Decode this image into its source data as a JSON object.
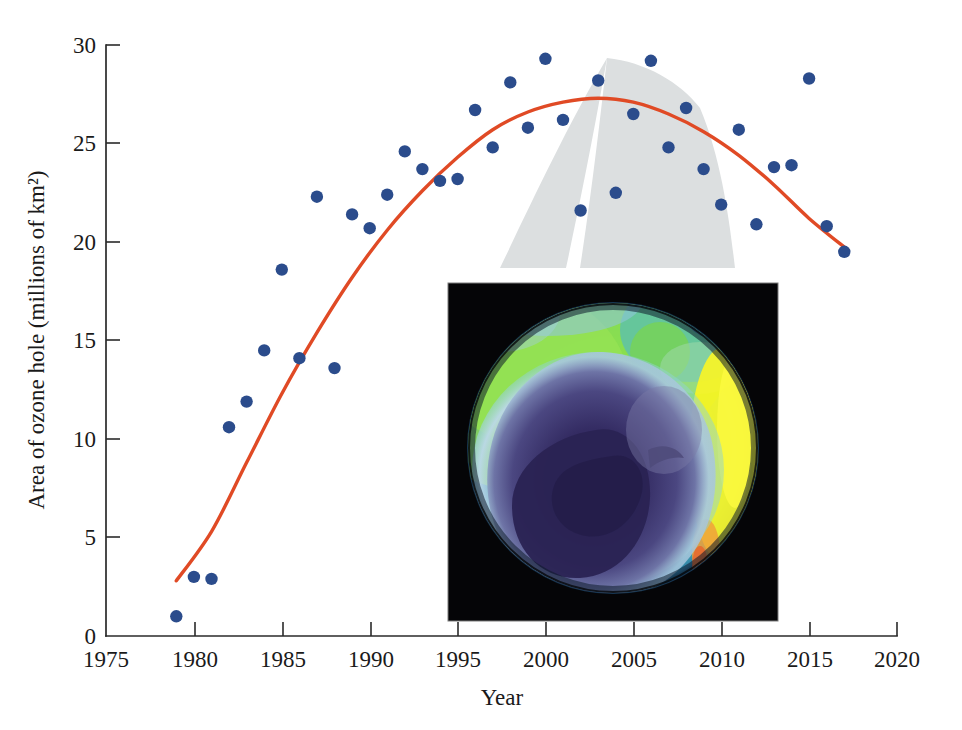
{
  "chart_data": {
    "type": "scatter",
    "title": "",
    "subtitle": "",
    "xlabel": "Year",
    "ylabel": "Area of ozone hole (millions of km²)",
    "xlim": [
      1975,
      2020
    ],
    "ylim": [
      0,
      30
    ],
    "xticks": [
      1975,
      1980,
      1985,
      1990,
      1995,
      2000,
      2005,
      2010,
      2015,
      2020
    ],
    "yticks": [
      0,
      5,
      10,
      15,
      20,
      25,
      30
    ],
    "xtick_labels": [
      "1975",
      "1980",
      "1985",
      "1990",
      "1995",
      "2000",
      "2005",
      "2010",
      "2015",
      "2020"
    ],
    "ytick_labels": [
      "0",
      "5",
      "10",
      "15",
      "20",
      "25",
      "30"
    ],
    "grid": false,
    "legend": false,
    "legend_position": "none",
    "series": [
      {
        "name": "Annual maximum ozone hole area",
        "type": "scatter",
        "marker": "circle",
        "color": "#2b4c8c",
        "x": [
          1979,
          1980,
          1981,
          1982,
          1983,
          1984,
          1985,
          1986,
          1987,
          1988,
          1989,
          1990,
          1991,
          1992,
          1993,
          1994,
          1995,
          1996,
          1997,
          1998,
          1999,
          2000,
          2001,
          2002,
          2003,
          2004,
          2005,
          2006,
          2007,
          2008,
          2009,
          2010,
          2011,
          2012,
          2013,
          2014,
          2015,
          2016,
          2017
        ],
        "values": [
          1.0,
          3.0,
          2.9,
          10.6,
          11.9,
          14.5,
          18.6,
          14.1,
          22.3,
          13.6,
          21.4,
          20.7,
          22.4,
          24.6,
          23.7,
          23.1,
          23.2,
          26.7,
          24.8,
          28.1,
          25.8,
          29.3,
          26.2,
          21.6,
          28.2,
          22.5,
          26.5,
          29.2,
          24.8,
          26.8,
          23.7,
          21.9,
          25.7,
          20.9,
          23.8,
          23.9,
          28.3,
          20.8,
          19.5
        ]
      },
      {
        "name": "Quadratic trend fit",
        "type": "line",
        "color": "#e04a25",
        "x": [
          1979.0,
          1981.0,
          1983.0,
          1985.0,
          1987.0,
          1989.0,
          1991.0,
          1993.0,
          1995.0,
          1997.0,
          1999.0,
          2001.0,
          2003.0,
          2005.0,
          2007.0,
          2009.0,
          2011.0,
          2013.0,
          2015.0,
          2017.2
        ],
        "values": [
          2.8,
          5.3,
          8.8,
          12.3,
          15.4,
          18.2,
          20.6,
          22.6,
          24.3,
          25.7,
          26.6,
          27.1,
          27.3,
          27.1,
          26.5,
          25.6,
          24.4,
          22.9,
          21.2,
          19.6
        ]
      }
    ],
    "annotations": [
      {
        "kind": "inset-image",
        "name": "ozone-hole-satellite-image",
        "description": "False-color satellite map of the Antarctic ozone hole: dark purple low-ozone core over Antarctica, pale blue ring, green mid-latitude band, bright yellow/orange high-ozone streak on the right limb, on a black background.",
        "x_range": [
          1995.6,
          2013.8
        ],
        "y_range": [
          0.6,
          17.9
        ]
      },
      {
        "kind": "callout-wedge",
        "name": "magnifier-callout-wedge",
        "description": "Light grey tapered wedge connecting the 2003 data region to the inset satellite image.",
        "apex": [
          2002.9,
          28.6
        ]
      }
    ]
  },
  "axes": {
    "x_axis_name": "year-axis",
    "y_axis_name": "ozone-area-axis"
  }
}
